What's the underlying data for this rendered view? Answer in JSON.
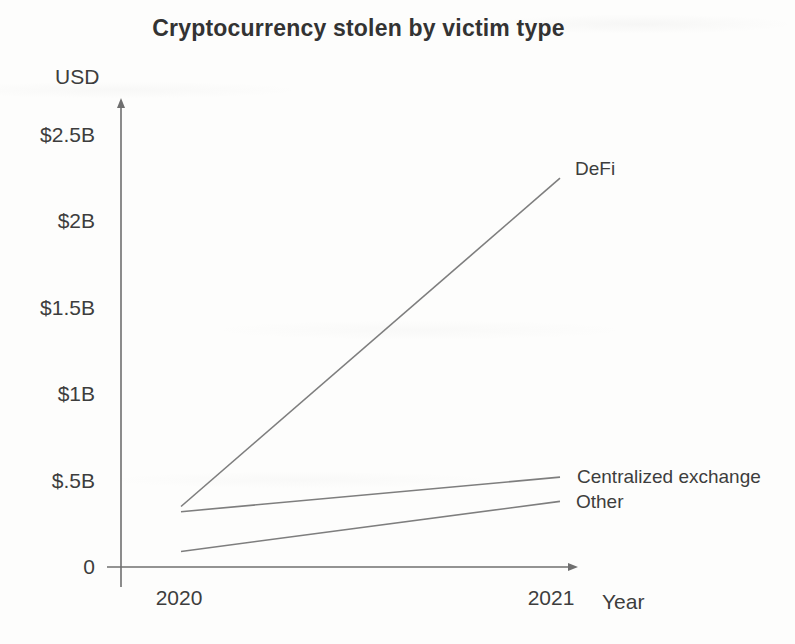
{
  "chart_data": {
    "type": "line",
    "title": "Cryptocurrency stolen by victim type",
    "ylabel": "USD",
    "xlabel": "Year",
    "x": [
      2020,
      2021
    ],
    "x_tick_labels": [
      "2020",
      "2021"
    ],
    "y_ticks": [
      {
        "value": 0,
        "label": "0"
      },
      {
        "value": 0.5,
        "label": "$.5B"
      },
      {
        "value": 1,
        "label": "$1B"
      },
      {
        "value": 1.5,
        "label": "$1.5B"
      },
      {
        "value": 2,
        "label": "$2B"
      },
      {
        "value": 2.5,
        "label": "$2.5B"
      }
    ],
    "xlim": [
      2020,
      2021
    ],
    "ylim": [
      0,
      2.7
    ],
    "units": "billions of USD",
    "grid": false,
    "legend_position": "line-end-labels",
    "series": [
      {
        "name": "DeFi",
        "values": [
          0.35,
          2.25
        ]
      },
      {
        "name": "Centralized exchange",
        "values": [
          0.32,
          0.52
        ]
      },
      {
        "name": "Other",
        "values": [
          0.09,
          0.38
        ]
      }
    ],
    "colors": {
      "line": "#7e7e7e",
      "axis": "#6f6f6f",
      "text": "#3d3d3d",
      "title": "#333333"
    }
  }
}
